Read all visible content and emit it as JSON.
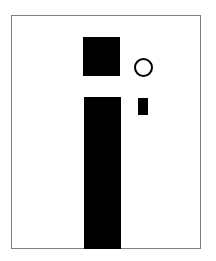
{
  "figure": {
    "frame": {
      "stroke": "#808080",
      "fill": "#ffffff"
    },
    "shapes": [
      {
        "id": "top-square",
        "type": "rect",
        "fill": "#000000"
      },
      {
        "id": "tall-bar",
        "type": "rect",
        "fill": "#000000"
      },
      {
        "id": "small-rect",
        "type": "rect",
        "fill": "#000000"
      },
      {
        "id": "hollow-circle",
        "type": "circle",
        "stroke": "#000000",
        "fill": "none"
      }
    ]
  }
}
